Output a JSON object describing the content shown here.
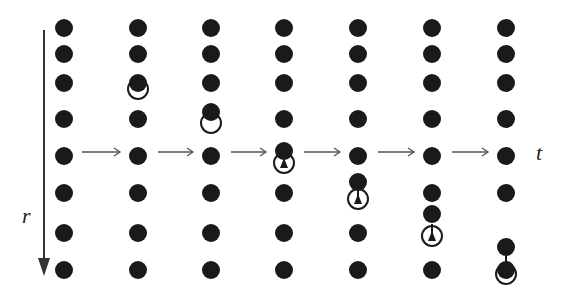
{
  "labels": {
    "r": "r",
    "t": "t"
  },
  "colors": {
    "dot": "#1a1a1a",
    "line": "#333333",
    "arrow": "#555555"
  },
  "columns_x": [
    64,
    138,
    211,
    284,
    358,
    432,
    506
  ],
  "rows_y": [
    28,
    54,
    83,
    119,
    156,
    193,
    233,
    270
  ],
  "dot_radius": 9,
  "arrow_y": 152,
  "columns": [
    {
      "dots": [
        28,
        54,
        83,
        119,
        156,
        193,
        233,
        270
      ],
      "hole": null
    },
    {
      "dots": [
        28,
        54,
        83,
        119,
        156,
        193,
        233,
        270
      ],
      "hole": {
        "y": 89,
        "marker": "none"
      }
    },
    {
      "dots": [
        28,
        54,
        83,
        112,
        156,
        193,
        233,
        270
      ],
      "hole": {
        "y": 123,
        "marker": "none"
      }
    },
    {
      "dots": [
        28,
        54,
        83,
        119,
        151,
        193,
        233,
        270
      ],
      "hole": {
        "y": 163,
        "marker": "triangle"
      }
    },
    {
      "dots": [
        28,
        54,
        83,
        119,
        156,
        182,
        233,
        270
      ],
      "hole": {
        "y": 199,
        "marker": "triangle"
      }
    },
    {
      "dots": [
        28,
        54,
        83,
        119,
        156,
        193,
        214,
        270
      ],
      "hole": {
        "y": 236,
        "marker": "triangle"
      }
    },
    {
      "dots": [
        28,
        54,
        83,
        119,
        156,
        193,
        247,
        270
      ],
      "hole": {
        "y": 274,
        "marker": "arrow"
      }
    }
  ]
}
